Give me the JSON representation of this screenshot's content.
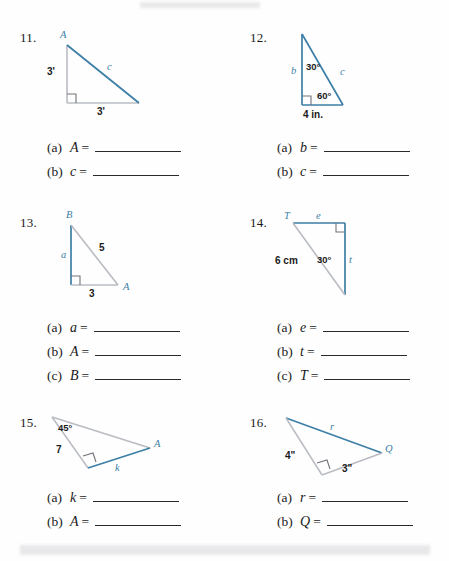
{
  "page": {
    "type": "math-worksheet"
  },
  "problems": [
    {
      "number": "11.",
      "figure": {
        "shape": "right-triangle",
        "vertices": [
          "A",
          "",
          ""
        ],
        "labels": {
          "vertex_top": "A",
          "leg_vertical": "3'",
          "leg_horizontal": "3'",
          "hypotenuse": "c"
        }
      },
      "answers": [
        {
          "tag": "(a)",
          "variable": "A",
          "equals": "=",
          "value": ""
        },
        {
          "tag": "(b)",
          "variable": "c",
          "equals": "=",
          "value": ""
        }
      ]
    },
    {
      "number": "12.",
      "figure": {
        "shape": "right-triangle",
        "labels": {
          "leg_vertical": "b",
          "hypotenuse": "c",
          "angle_top": "30°",
          "angle_bottom": "60°",
          "base": "4 in."
        }
      },
      "answers": [
        {
          "tag": "(a)",
          "variable": "b",
          "equals": "=",
          "value": ""
        },
        {
          "tag": "(b)",
          "variable": "c",
          "equals": "=",
          "value": ""
        }
      ]
    },
    {
      "number": "13.",
      "figure": {
        "shape": "right-triangle",
        "labels": {
          "vertex_top": "B",
          "vertex_right": "A",
          "leg_vertical": "a",
          "hypotenuse": "5",
          "base": "3"
        }
      },
      "answers": [
        {
          "tag": "(a)",
          "variable": "a",
          "equals": "=",
          "value": ""
        },
        {
          "tag": "(b)",
          "variable": "A",
          "equals": "=",
          "value": ""
        },
        {
          "tag": "(c)",
          "variable": "B",
          "equals": "=",
          "value": ""
        }
      ]
    },
    {
      "number": "14.",
      "figure": {
        "shape": "right-triangle",
        "labels": {
          "vertex_left": "T",
          "top_side": "e",
          "right_side": "t",
          "hypotenuse": "6 cm",
          "angle": "30°"
        }
      },
      "answers": [
        {
          "tag": "(a)",
          "variable": "e",
          "equals": "=",
          "value": ""
        },
        {
          "tag": "(b)",
          "variable": "t",
          "equals": "=",
          "value": ""
        },
        {
          "tag": "(c)",
          "variable": "T",
          "equals": "=",
          "value": ""
        }
      ]
    },
    {
      "number": "15.",
      "figure": {
        "shape": "right-triangle",
        "labels": {
          "angle": "45°",
          "side_left": "7",
          "side_lower": "k",
          "vertex_right": "A"
        }
      },
      "answers": [
        {
          "tag": "(a)",
          "variable": "k",
          "equals": "=",
          "value": ""
        },
        {
          "tag": "(b)",
          "variable": "A",
          "equals": "=",
          "value": ""
        }
      ]
    },
    {
      "number": "16.",
      "figure": {
        "shape": "right-triangle",
        "labels": {
          "hypotenuse": "r",
          "side_left": "4\"",
          "side_right": "3\"",
          "vertex_right": "Q"
        }
      },
      "answers": [
        {
          "tag": "(a)",
          "variable": "r",
          "equals": "=",
          "value": ""
        },
        {
          "tag": "(b)",
          "variable": "Q",
          "equals": "=",
          "value": ""
        }
      ]
    }
  ],
  "colors": {
    "accent_blue": "#3d7fa6",
    "line_gray": "#b9bcc2",
    "text": "#1a1a1a"
  }
}
